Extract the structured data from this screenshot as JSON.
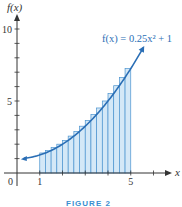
{
  "chart_data": {
    "type": "area",
    "title": "",
    "function": "f(x) = 0.25x^2 + 1",
    "equation_label": "f(x) = 0.25x² + 1",
    "xlabel": "x",
    "ylabel": "f(x)",
    "xlim": [
      0,
      7
    ],
    "ylim": [
      0,
      10.5
    ],
    "x_ticks": [
      1,
      2,
      3,
      4,
      5,
      6
    ],
    "x_tick_labels": [
      {
        "value": 0,
        "label": "0"
      },
      {
        "value": 1,
        "label": "1"
      },
      {
        "value": 5,
        "label": "5"
      }
    ],
    "y_ticks": [
      1,
      2,
      3,
      4,
      5,
      6,
      7,
      8,
      9,
      10
    ],
    "y_tick_labels": [
      {
        "value": 5,
        "label": "5"
      },
      {
        "value": 10,
        "label": "10"
      }
    ],
    "curve_domain": [
      0.3,
      5.55
    ],
    "rectangles": {
      "method": "right-endpoint",
      "interval": [
        1,
        5
      ],
      "n": 16,
      "width": 0.25,
      "x_left": [
        1.0,
        1.25,
        1.5,
        1.75,
        2.0,
        2.25,
        2.5,
        2.75,
        3.0,
        3.25,
        3.5,
        3.75,
        4.0,
        4.25,
        4.5,
        4.75
      ],
      "heights": [
        1.3906,
        1.5625,
        1.7656,
        2.0,
        2.2656,
        2.5625,
        2.8906,
        3.25,
        3.6406,
        4.0625,
        4.5156,
        5.0,
        5.5156,
        6.0625,
        6.6406,
        7.25
      ]
    },
    "grid": false,
    "colors": {
      "rect_fill": "#d4e8f7",
      "rect_stroke": "#4a93cf",
      "curve": "#2a6eb5",
      "axis": "#333333"
    }
  },
  "caption": {
    "figure_label": "FIGURE 2"
  }
}
